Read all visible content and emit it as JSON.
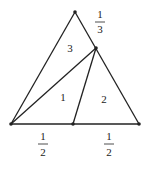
{
  "diagram": {
    "points": {
      "A": {
        "x": 11,
        "y": 124
      },
      "B": {
        "x": 139,
        "y": 124
      },
      "C": {
        "x": 75,
        "y": 12
      },
      "M": {
        "x": 73,
        "y": 124
      },
      "P": {
        "x": 96,
        "y": 48
      }
    },
    "region_labels": [
      {
        "text": "3",
        "x": 70,
        "y": 52
      },
      {
        "text": "1",
        "x": 63,
        "y": 101
      },
      {
        "text": "2",
        "x": 104,
        "y": 103
      }
    ],
    "fractions": [
      {
        "num": "1",
        "den": "3",
        "x": 100,
        "y_num": 18,
        "y_den": 34
      },
      {
        "num": "1",
        "den": "2",
        "x": 43,
        "y_num": 139,
        "y_den": 157
      },
      {
        "num": "1",
        "den": "2",
        "x": 109,
        "y_num": 139,
        "y_den": 157
      }
    ],
    "colors": {
      "line": "#222222",
      "background": "#ffffff"
    }
  }
}
